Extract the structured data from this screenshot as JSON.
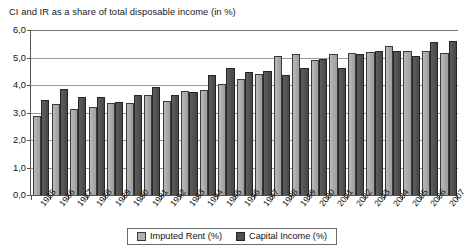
{
  "chart_data": {
    "type": "bar",
    "title": "CI and IR as a share of total disposable income (in %)",
    "xlabel": "",
    "ylabel": "",
    "ylim": [
      0.0,
      6.0
    ],
    "ytick_labels": [
      "0,0",
      "1,0",
      "2,0",
      "3,0",
      "4,0",
      "5,0",
      "6,0"
    ],
    "ytick_values": [
      0.0,
      1.0,
      2.0,
      3.0,
      4.0,
      5.0,
      6.0
    ],
    "grid": true,
    "legend_position": "bottom-center",
    "categories": [
      "1985",
      "1986",
      "1987",
      "1988",
      "1989",
      "1990",
      "1991",
      "1992",
      "1993",
      "1994",
      "1995",
      "1996",
      "1997",
      "1998",
      "1999",
      "2000",
      "2001",
      "2002",
      "2003",
      "2004",
      "2005",
      "2006",
      "2007"
    ],
    "series": [
      {
        "name": "Imputed Rent (%)",
        "color": "#aeaeae",
        "values": [
          2.87,
          3.3,
          3.12,
          3.2,
          3.35,
          3.34,
          3.64,
          3.42,
          3.77,
          3.83,
          4.02,
          4.21,
          4.39,
          5.04,
          5.12,
          4.92,
          5.12,
          5.15,
          5.19,
          5.42,
          5.23,
          5.23,
          5.15
        ]
      },
      {
        "name": "Capital Income (%)",
        "color": "#505050",
        "values": [
          3.44,
          3.85,
          3.56,
          3.55,
          3.37,
          3.62,
          3.91,
          3.62,
          3.73,
          4.35,
          4.63,
          4.47,
          4.5,
          4.37,
          4.61,
          4.93,
          4.61,
          5.14,
          5.22,
          5.23,
          5.06,
          5.57,
          5.61
        ]
      }
    ]
  },
  "legend": {
    "items": [
      {
        "label": "Imputed Rent (%)"
      },
      {
        "label": "Capital Income (%)"
      }
    ]
  }
}
